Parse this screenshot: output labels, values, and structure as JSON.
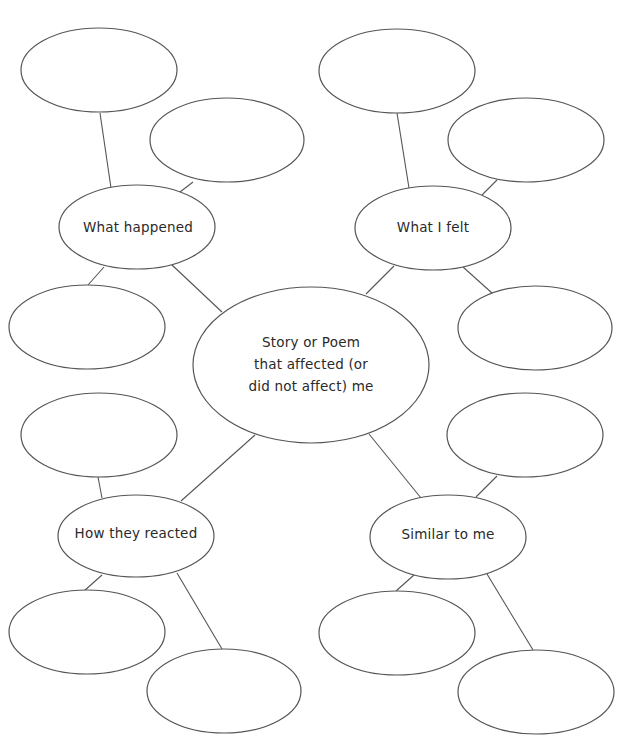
{
  "diagram": {
    "type": "web-graphic-organizer",
    "colors": {
      "stroke": "#555555",
      "text": "#2a2a2a",
      "background": "#ffffff"
    },
    "center": {
      "label": "Story or Poem\nthat affected (or\ndid not affect) me",
      "cx": 311,
      "cy": 365,
      "rx": 118,
      "ry": 78
    },
    "categories": [
      {
        "id": "what-happened",
        "label": "What happened",
        "cx": 137,
        "cy": 227,
        "rx": 78,
        "ry": 42
      },
      {
        "id": "what-i-felt",
        "label": "What I felt",
        "cx": 433,
        "cy": 228,
        "rx": 78,
        "ry": 42
      },
      {
        "id": "how-they-reacted",
        "label": "How they reacted",
        "cx": 136,
        "cy": 536,
        "rx": 78,
        "ry": 41
      },
      {
        "id": "similar-to-me",
        "label": "Similar to me",
        "cx": 448,
        "cy": 537,
        "rx": 78,
        "ry": 42
      }
    ],
    "blank_nodes": [
      {
        "id": "what-happened-1",
        "parent": "what-happened",
        "cx": 99,
        "cy": 70,
        "rx": 78,
        "ry": 42
      },
      {
        "id": "what-happened-2",
        "parent": "what-happened",
        "cx": 227,
        "cy": 140,
        "rx": 77,
        "ry": 42
      },
      {
        "id": "what-happened-3",
        "parent": "what-happened",
        "cx": 87,
        "cy": 327,
        "rx": 78,
        "ry": 42
      },
      {
        "id": "what-i-felt-1",
        "parent": "what-i-felt",
        "cx": 397,
        "cy": 71,
        "rx": 78,
        "ry": 42
      },
      {
        "id": "what-i-felt-2",
        "parent": "what-i-felt",
        "cx": 526,
        "cy": 140,
        "rx": 78,
        "ry": 42
      },
      {
        "id": "what-i-felt-3",
        "parent": "what-i-felt",
        "cx": 535,
        "cy": 328,
        "rx": 77,
        "ry": 42
      },
      {
        "id": "how-they-reacted-1",
        "parent": "how-they-reacted",
        "cx": 99,
        "cy": 435,
        "rx": 78,
        "ry": 42
      },
      {
        "id": "how-they-reacted-2",
        "parent": "how-they-reacted",
        "cx": 87,
        "cy": 632,
        "rx": 78,
        "ry": 42
      },
      {
        "id": "how-they-reacted-3",
        "parent": "how-they-reacted",
        "cx": 224,
        "cy": 691,
        "rx": 77,
        "ry": 42
      },
      {
        "id": "similar-to-me-1",
        "parent": "similar-to-me",
        "cx": 525,
        "cy": 435,
        "rx": 78,
        "ry": 42
      },
      {
        "id": "similar-to-me-2",
        "parent": "similar-to-me",
        "cx": 397,
        "cy": 633,
        "rx": 78,
        "ry": 42
      },
      {
        "id": "similar-to-me-3",
        "parent": "similar-to-me",
        "cx": 536,
        "cy": 692,
        "rx": 78,
        "ry": 42
      }
    ],
    "connectors": [
      {
        "from": "center",
        "to": "what-happened",
        "x1": 222,
        "y1": 312,
        "x2": 172,
        "y2": 265
      },
      {
        "from": "center",
        "to": "what-i-felt",
        "x1": 366,
        "y1": 294,
        "x2": 394,
        "y2": 266
      },
      {
        "from": "center",
        "to": "how-they-reacted",
        "x1": 255,
        "y1": 435,
        "x2": 181,
        "y2": 501
      },
      {
        "from": "center",
        "to": "similar-to-me",
        "x1": 369,
        "y1": 434,
        "x2": 421,
        "y2": 498
      },
      {
        "from": "what-happened",
        "to": "what-happened-1",
        "x1": 111,
        "y1": 188,
        "x2": 100,
        "y2": 113
      },
      {
        "from": "what-happened",
        "to": "what-happened-2",
        "x1": 180,
        "y1": 192,
        "x2": 193,
        "y2": 182
      },
      {
        "from": "what-happened",
        "to": "what-happened-3",
        "x1": 104,
        "y1": 267,
        "x2": 88,
        "y2": 285
      },
      {
        "from": "what-i-felt",
        "to": "what-i-felt-1",
        "x1": 409,
        "y1": 188,
        "x2": 397,
        "y2": 113
      },
      {
        "from": "what-i-felt",
        "to": "what-i-felt-2",
        "x1": 482,
        "y1": 195,
        "x2": 497,
        "y2": 180
      },
      {
        "from": "what-i-felt",
        "to": "what-i-felt-3",
        "x1": 463,
        "y1": 267,
        "x2": 492,
        "y2": 293
      },
      {
        "from": "how-they-reacted",
        "to": "how-they-reacted-1",
        "x1": 102,
        "y1": 498,
        "x2": 98,
        "y2": 477
      },
      {
        "from": "how-they-reacted",
        "to": "how-they-reacted-2",
        "x1": 102,
        "y1": 575,
        "x2": 84,
        "y2": 591
      },
      {
        "from": "how-they-reacted",
        "to": "how-they-reacted-3",
        "x1": 177,
        "y1": 573,
        "x2": 222,
        "y2": 649
      },
      {
        "from": "similar-to-me",
        "to": "similar-to-me-1",
        "x1": 476,
        "y1": 497,
        "x2": 497,
        "y2": 476
      },
      {
        "from": "similar-to-me",
        "to": "similar-to-me-2",
        "x1": 414,
        "y1": 575,
        "x2": 396,
        "y2": 591
      },
      {
        "from": "similar-to-me",
        "to": "similar-to-me-3",
        "x1": 487,
        "y1": 574,
        "x2": 533,
        "y2": 650
      }
    ]
  }
}
